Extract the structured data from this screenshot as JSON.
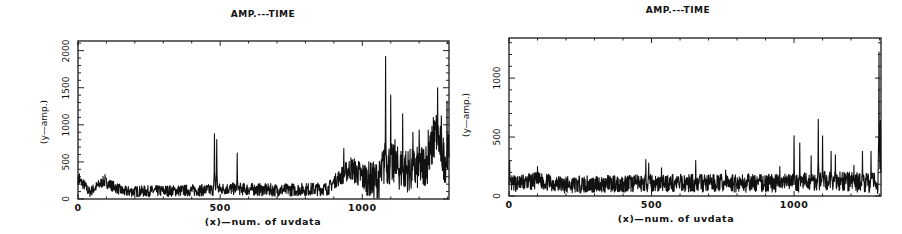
{
  "chart_data": [
    {
      "type": "line",
      "title": "AMP.---TIME",
      "xlabel": "(x)—num. of uvdata",
      "ylabel": "(y—amp.)",
      "xlim": [
        0,
        1305
      ],
      "ylim": [
        0,
        2130
      ],
      "xticks": [
        0,
        500,
        1000
      ],
      "xtick_labels": [
        "0",
        "500",
        "1000"
      ],
      "yticks": [
        0,
        500,
        1000,
        1500,
        2000
      ],
      "ytick_labels": [
        "0",
        "500",
        "1000",
        "1500",
        "2000"
      ],
      "grid": false,
      "baseline": [
        [
          0,
          260
        ],
        [
          20,
          200
        ],
        [
          40,
          90
        ],
        [
          90,
          240
        ],
        [
          110,
          200
        ],
        [
          160,
          100
        ],
        [
          300,
          110
        ],
        [
          460,
          120
        ],
        [
          520,
          140
        ],
        [
          700,
          120
        ],
        [
          880,
          140
        ],
        [
          900,
          230
        ],
        [
          960,
          420
        ],
        [
          1000,
          300
        ],
        [
          1040,
          250
        ],
        [
          1060,
          250
        ],
        [
          1080,
          500
        ],
        [
          1120,
          420
        ],
        [
          1180,
          380
        ],
        [
          1230,
          500
        ],
        [
          1260,
          900
        ],
        [
          1275,
          700
        ],
        [
          1290,
          500
        ],
        [
          1305,
          620
        ]
      ],
      "noise": [
        [
          0,
          70
        ],
        [
          900,
          90
        ],
        [
          1075,
          300
        ],
        [
          1305,
          300
        ]
      ],
      "peaks": [
        [
          5,
          340
        ],
        [
          95,
          330
        ],
        [
          480,
          880
        ],
        [
          488,
          800
        ],
        [
          560,
          620
        ],
        [
          935,
          680
        ],
        [
          965,
          500
        ],
        [
          1082,
          1920
        ],
        [
          1100,
          1400
        ],
        [
          1115,
          800
        ],
        [
          1142,
          1150
        ],
        [
          1178,
          900
        ],
        [
          1200,
          930
        ],
        [
          1232,
          930
        ],
        [
          1250,
          1100
        ],
        [
          1265,
          1500
        ],
        [
          1278,
          1120
        ],
        [
          1298,
          1320
        ]
      ],
      "description": "Amplitude vs. uv-data index; baseline ~100 up to ~900, rising to ~300-500 after 900, with strong spikes up to ~1920 near x=1080."
    },
    {
      "type": "line",
      "title": "AMP.---TIME",
      "xlabel": "(x)—num. of uvdata",
      "ylabel": "(y—amp.)",
      "xlim": [
        0,
        1305
      ],
      "ylim": [
        0,
        1340
      ],
      "xticks": [
        0,
        500,
        1000
      ],
      "xtick_labels": [
        "0",
        "500",
        "1000"
      ],
      "yticks": [
        0,
        500,
        1000
      ],
      "ytick_labels": [
        "0",
        "500",
        "1000"
      ],
      "grid": false,
      "baseline": [
        [
          0,
          100
        ],
        [
          100,
          130
        ],
        [
          200,
          95
        ],
        [
          480,
          110
        ],
        [
          700,
          110
        ],
        [
          1000,
          110
        ],
        [
          1090,
          130
        ],
        [
          1305,
          110
        ]
      ],
      "noise": [
        [
          0,
          70
        ],
        [
          1000,
          80
        ],
        [
          1305,
          90
        ]
      ],
      "peaks": [
        [
          2,
          300
        ],
        [
          100,
          250
        ],
        [
          480,
          310
        ],
        [
          490,
          280
        ],
        [
          535,
          240
        ],
        [
          655,
          300
        ],
        [
          760,
          220
        ],
        [
          950,
          250
        ],
        [
          1000,
          510
        ],
        [
          1020,
          450
        ],
        [
          1060,
          340
        ],
        [
          1085,
          650
        ],
        [
          1100,
          510
        ],
        [
          1130,
          380
        ],
        [
          1145,
          350
        ],
        [
          1210,
          260
        ],
        [
          1240,
          380
        ],
        [
          1270,
          380
        ],
        [
          1298,
          1220
        ],
        [
          1303,
          640
        ]
      ],
      "description": "Amplitude vs. uv-data index after processing; baseline ~100 throughout with peaks up to ~650 near x=1085 and an edge spike ~1220 at the end."
    }
  ],
  "panels": [
    {
      "title": "AMP.---TIME",
      "xlabel": "(x)—num. of uvdata",
      "ylabel": "(y—amp.)"
    },
    {
      "title": "AMP.---TIME",
      "xlabel": "(x)—num. of uvdata",
      "ylabel": "(y—amp.)"
    }
  ],
  "style": {
    "line_color": "#111111",
    "frame_color": "#1a1a1a",
    "background": "#ffffff"
  }
}
